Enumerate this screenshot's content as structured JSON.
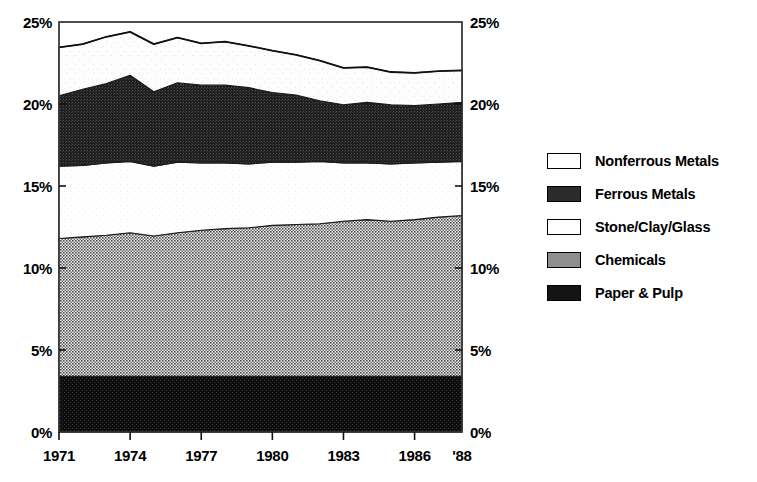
{
  "chart_data": {
    "type": "area",
    "title": "",
    "subtitle": "",
    "xlabel": "",
    "ylabel": "",
    "stacked": true,
    "grid": false,
    "legend_position": "right",
    "xlim": [
      1971,
      1988
    ],
    "ylim": [
      0,
      25
    ],
    "y_tick_labels": [
      "0%",
      "5%",
      "10%",
      "15%",
      "20%",
      "25%"
    ],
    "y_tick_values": [
      0,
      5,
      10,
      15,
      20,
      25
    ],
    "y_axis_duplicated_right": true,
    "x_tick_labels": [
      "1971",
      "1974",
      "1977",
      "1980",
      "1983",
      "1986",
      "'88"
    ],
    "x_tick_values": [
      1971,
      1974,
      1977,
      1980,
      1983,
      1986,
      1988
    ],
    "x": [
      1971,
      1972,
      1973,
      1974,
      1975,
      1976,
      1977,
      1978,
      1979,
      1980,
      1981,
      1982,
      1983,
      1984,
      1985,
      1986,
      1987,
      1988
    ],
    "series": [
      {
        "name": "Paper & Pulp",
        "fill": "#1b1b1b",
        "values": [
          3.4,
          3.4,
          3.4,
          3.4,
          3.4,
          3.4,
          3.4,
          3.4,
          3.4,
          3.4,
          3.4,
          3.4,
          3.4,
          3.4,
          3.4,
          3.4,
          3.4,
          3.4
        ]
      },
      {
        "name": "Chemicals",
        "fill": "#8a8a8a",
        "values": [
          8.4,
          8.5,
          8.6,
          8.75,
          8.55,
          8.75,
          8.9,
          9.0,
          9.05,
          9.2,
          9.25,
          9.3,
          9.45,
          9.55,
          9.45,
          9.55,
          9.7,
          9.8
        ]
      },
      {
        "name": "Stone/Clay/Glass",
        "fill": "#ffffff",
        "values": [
          4.4,
          4.35,
          4.4,
          4.35,
          4.25,
          4.3,
          4.1,
          4.0,
          3.9,
          3.85,
          3.8,
          3.8,
          3.55,
          3.45,
          3.5,
          3.45,
          3.35,
          3.3
        ]
      },
      {
        "name": "Ferrous Metals",
        "fill": "#2b2b2b",
        "values": [
          4.3,
          4.65,
          4.85,
          5.25,
          4.55,
          4.85,
          4.75,
          4.75,
          4.65,
          4.25,
          4.1,
          3.7,
          3.55,
          3.7,
          3.6,
          3.5,
          3.55,
          3.6
        ]
      },
      {
        "name": "Nonferrous Metals",
        "fill": "#ffffff",
        "values": [
          2.95,
          2.75,
          2.85,
          2.65,
          2.9,
          2.75,
          2.55,
          2.65,
          2.55,
          2.55,
          2.45,
          2.45,
          2.25,
          2.15,
          2.0,
          2.0,
          2.0,
          1.95
        ]
      }
    ],
    "totals": [
      23.45,
      23.65,
      24.1,
      24.4,
      23.65,
      24.05,
      23.7,
      23.8,
      23.55,
      23.25,
      23.0,
      22.65,
      22.2,
      22.25,
      21.95,
      21.9,
      22.0,
      22.05
    ]
  },
  "legend": {
    "items": [
      {
        "label": "Nonferrous Metals",
        "swatch": "white"
      },
      {
        "label": "Ferrous Metals",
        "swatch": "dark"
      },
      {
        "label": "Stone/Clay/Glass",
        "swatch": "white"
      },
      {
        "label": "Chemicals",
        "swatch": "gray"
      },
      {
        "label": "Paper & Pulp",
        "swatch": "black"
      }
    ]
  }
}
